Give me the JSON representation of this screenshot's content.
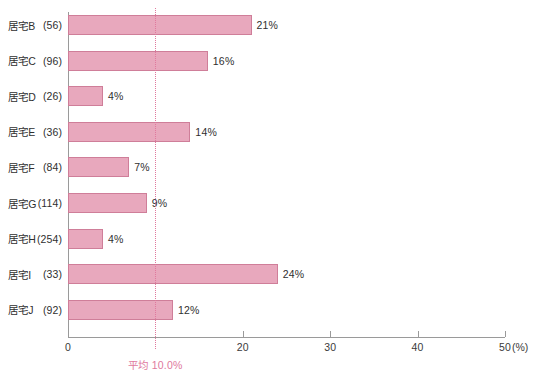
{
  "chart_data": {
    "type": "bar",
    "orientation": "horizontal",
    "title": "",
    "xlabel": "(%)",
    "ylabel": "",
    "xlim": [
      0,
      50
    ],
    "grid": false,
    "legend": null,
    "categories": [
      "居宅B（56）",
      "居宅C（96）",
      "居宅D（26）",
      "居宅E（36）",
      "居宅F（84）",
      "居宅G（114）",
      "居宅H（254）",
      "居宅I（33）",
      "居宅J（92）"
    ],
    "category_names": [
      "居宅B",
      "居宅C",
      "居宅D",
      "居宅E",
      "居宅F",
      "居宅G",
      "居宅H",
      "居宅I",
      "居宅J"
    ],
    "category_counts": [
      "(56)",
      "(96)",
      "(26)",
      "(36)",
      "(84)",
      "(114)",
      "(254)",
      "(33)",
      "(92)"
    ],
    "values": [
      21,
      16,
      4,
      14,
      7,
      9,
      4,
      24,
      12
    ],
    "value_labels": [
      "21%",
      "16%",
      "4%",
      "14%",
      "7%",
      "9%",
      "4%",
      "24%",
      "12%"
    ],
    "xticks": [
      0,
      20,
      30,
      40,
      50
    ],
    "xtick_labels": [
      "0",
      "20",
      "30",
      "40",
      "50"
    ],
    "x_unit_label": "(%)",
    "annotations": [
      {
        "type": "vertical-reference-line",
        "value": 10.0,
        "label": "平均 10.0%",
        "style": "dotted",
        "color": "#e0799d"
      }
    ],
    "colors": {
      "bar_fill": "#e8a8bd",
      "bar_border": "#cf7e99",
      "axis": "#9a9a9a",
      "text": "#2f2f2f",
      "average_line": "#e0799d",
      "background": "#ffffff"
    }
  }
}
